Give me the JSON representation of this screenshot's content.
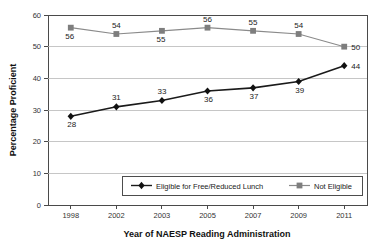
{
  "chart_data": {
    "type": "line",
    "title": "",
    "xlabel": "Year of NAESP Reading Administration",
    "ylabel": "Percentage Proficient",
    "categories": [
      "1998",
      "2002",
      "2003",
      "2005",
      "2007",
      "2009",
      "2011"
    ],
    "ylim": [
      0,
      60
    ],
    "yticks": [
      0,
      10,
      20,
      30,
      40,
      50,
      60
    ],
    "ytick_labels": [
      "0",
      "10",
      "20",
      "30",
      "40",
      "50",
      "60"
    ],
    "grid": "horizontal",
    "legend_position": "inside-bottom-center",
    "series": [
      {
        "name": "Eligible for Free/Reduced Lunch",
        "marker": "diamond",
        "color": "#1a1a1a",
        "values": [
          28,
          31,
          33,
          36,
          37,
          39,
          44
        ],
        "value_labels": [
          "28",
          "31",
          "33",
          "36",
          "37",
          "39",
          "44"
        ]
      },
      {
        "name": "Not Eligible",
        "marker": "square",
        "color": "#7e7e7e",
        "values": [
          56,
          54,
          55,
          56,
          55,
          54,
          50
        ],
        "value_labels": [
          "56",
          "54",
          "55",
          "56",
          "55",
          "54",
          "50"
        ]
      }
    ]
  },
  "legend": {
    "items": [
      {
        "label": "Eligible for Free/Reduced Lunch"
      },
      {
        "label": "Not Eligible"
      }
    ]
  },
  "colors": {
    "series_dark": "#1a1a1a",
    "series_gray": "#7e7e7e",
    "gridline": "#b8b8b8",
    "axis": "#4a4a4a",
    "background": "#ffffff"
  }
}
